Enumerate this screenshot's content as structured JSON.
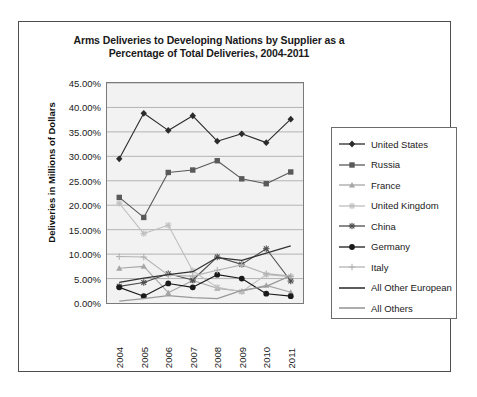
{
  "chart_data": {
    "type": "line",
    "title": "Arms Deliveries to Developing Nations by Supplier as a Percentage of Total Deliveries, 2004-2011",
    "title_line1": "Arms Deliveries to Developing Nations by Supplier as a",
    "title_line2": "Percentage of Total Deliveries, 2004-2011",
    "xlabel": "",
    "ylabel": "Deliveries in Millions of Dollars",
    "categories": [
      "2004",
      "2005",
      "2006",
      "2007",
      "2008",
      "2009",
      "2010",
      "2011"
    ],
    "x": [
      2004,
      2005,
      2006,
      2007,
      2008,
      2009,
      2010,
      2011
    ],
    "ylim": [
      0,
      45
    ],
    "ytick_labels": [
      "0.00%",
      "5.00%",
      "10.00%",
      "15.00%",
      "20.00%",
      "25.00%",
      "30.00%",
      "35.00%",
      "40.00%",
      "45.00%"
    ],
    "ytick_values": [
      0,
      5,
      10,
      15,
      20,
      25,
      30,
      35,
      40,
      45
    ],
    "grid": "horizontal",
    "legend_position": "right",
    "plot_background": "#f2f2f2",
    "series": [
      {
        "name": "United States",
        "marker": "diamond",
        "color": "#2b2b2b",
        "values": [
          29.5,
          38.8,
          35.3,
          38.3,
          33.1,
          34.6,
          32.8,
          37.6
        ]
      },
      {
        "name": "Russia",
        "marker": "square",
        "color": "#595959",
        "values": [
          21.6,
          17.5,
          26.7,
          27.2,
          29.1,
          25.4,
          24.4,
          26.8
        ]
      },
      {
        "name": "France",
        "marker": "triangle",
        "color": "#a6a6a6",
        "values": [
          7.1,
          7.5,
          2.1,
          4.6,
          3.0,
          2.4,
          3.6,
          2.2
        ]
      },
      {
        "name": "United Kingdom",
        "marker": "star",
        "color": "#bfbfbf",
        "values": [
          20.4,
          14.2,
          15.9,
          6.6,
          3.2,
          2.3,
          5.8,
          5.4
        ]
      },
      {
        "name": "China",
        "marker": "asterisk",
        "color": "#4d4d4d",
        "values": [
          3.4,
          4.2,
          6.0,
          4.7,
          9.4,
          7.9,
          11.1,
          4.5
        ]
      },
      {
        "name": "Germany",
        "marker": "circle",
        "color": "#1a1a1a",
        "values": [
          3.2,
          1.4,
          4.0,
          3.2,
          5.8,
          5.0,
          1.9,
          1.4
        ]
      },
      {
        "name": "Italy",
        "marker": "plus",
        "color": "#b3b3b3",
        "values": [
          9.5,
          9.4,
          5.7,
          5.5,
          6.7,
          7.8,
          6.0,
          5.5
        ]
      },
      {
        "name": "All Other European",
        "marker": "none",
        "color": "#333333",
        "values": [
          4.2,
          5.1,
          5.8,
          6.4,
          9.3,
          8.7,
          10.2,
          11.7
        ]
      },
      {
        "name": "All Others",
        "marker": "none",
        "color": "#999999",
        "values": [
          0.4,
          0.9,
          1.5,
          1.1,
          0.9,
          2.6,
          3.4,
          5.6
        ]
      }
    ]
  }
}
